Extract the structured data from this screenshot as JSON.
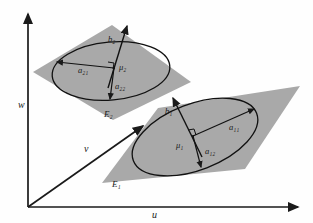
{
  "figure": {
    "kind": "3d-geometry-diagram",
    "background_color": "#fefefe",
    "plane_fill_color": "#a9a9a9",
    "stroke_color": "#1a1a1a",
    "width": 313,
    "height": 223
  },
  "axes": {
    "origin_label": "",
    "items": [
      {
        "id": "w",
        "label": "w",
        "direction": "up",
        "label_x": 18,
        "label_y": 108
      },
      {
        "id": "v",
        "label": "v",
        "direction": "diagonal",
        "label_x": 84,
        "label_y": 152
      },
      {
        "id": "u",
        "label": "u",
        "direction": "right",
        "label_x": 152,
        "label_y": 218
      }
    ]
  },
  "planes": [
    {
      "id": "E2",
      "label": "E₂",
      "label_x": 104,
      "label_y": 115,
      "position": "upper-left",
      "ellipse": {
        "center_label": "μ₂",
        "center_label_x": 121,
        "center_label_y": 67,
        "semi_axis_major": {
          "label": "a₂₁",
          "label_x": 78,
          "label_y": 73
        },
        "semi_axis_minor": {
          "label": "a₂₂",
          "label_x": 115,
          "label_y": 89
        }
      },
      "normal_vector": {
        "label": "b₂",
        "label_x": 108,
        "label_y": 42
      }
    },
    {
      "id": "E1",
      "label": "E₁",
      "label_x": 113,
      "label_y": 185,
      "position": "lower-right",
      "ellipse": {
        "center_label": "μ₁",
        "center_label_x": 180,
        "center_label_y": 145,
        "semi_axis_major": {
          "label": "a₁₁",
          "label_x": 232,
          "label_y": 128
        },
        "semi_axis_minor": {
          "label": "a₁₂",
          "label_x": 208,
          "label_y": 152
        }
      },
      "normal_vector": {
        "label": "b₁",
        "label_x": 168,
        "label_y": 112
      }
    }
  ]
}
